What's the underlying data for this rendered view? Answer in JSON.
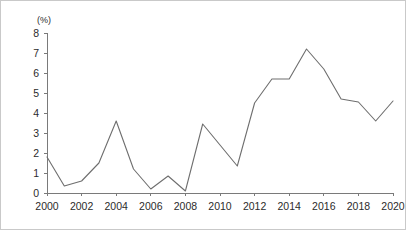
{
  "chart_data": {
    "type": "line",
    "title": "",
    "subtitle": "",
    "xlabel": "",
    "ylabel": "",
    "unit_label": "(%)",
    "grid": false,
    "legend": false,
    "legend_position": "none",
    "line_color": "#6e6e6e",
    "axis_color": "#7a7a7a",
    "background_color": "#ffffff",
    "border_color": "#c9c9c9",
    "xlim": [
      2000,
      2020
    ],
    "ylim": [
      0,
      8
    ],
    "y_ticks": [
      0,
      1,
      2,
      3,
      4,
      5,
      6,
      7,
      8
    ],
    "y_tick_labels": [
      "0",
      "1",
      "2",
      "3",
      "4",
      "5",
      "6",
      "7",
      "8"
    ],
    "x_ticks": [
      2000,
      2002,
      2004,
      2006,
      2008,
      2010,
      2012,
      2014,
      2016,
      2018,
      2020
    ],
    "x_tick_labels": [
      "2000",
      "2002",
      "2004",
      "2006",
      "2008",
      "2010",
      "2012",
      "2014",
      "2016",
      "2018",
      "2020"
    ],
    "x": [
      2000,
      2001,
      2002,
      2003,
      2004,
      2005,
      2006,
      2007,
      2008,
      2009,
      2010,
      2011,
      2012,
      2013,
      2014,
      2015,
      2016,
      2017,
      2018,
      2019,
      2020
    ],
    "values": [
      1.8,
      0.35,
      0.6,
      1.5,
      3.6,
      1.2,
      0.2,
      0.85,
      0.1,
      3.45,
      2.4,
      1.35,
      4.5,
      5.7,
      5.7,
      7.2,
      6.2,
      4.7,
      4.55,
      3.6,
      4.6
    ],
    "series": [
      {
        "name": "series-1",
        "values": [
          1.8,
          0.35,
          0.6,
          1.5,
          3.6,
          1.2,
          0.2,
          0.85,
          0.1,
          3.45,
          2.4,
          1.35,
          4.5,
          5.7,
          5.7,
          7.2,
          6.2,
          4.7,
          4.55,
          3.6,
          4.6
        ]
      }
    ],
    "annotations": []
  }
}
